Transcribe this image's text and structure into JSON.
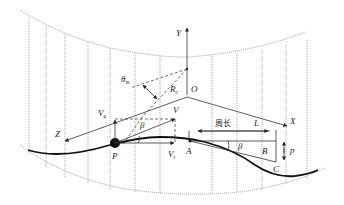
{
  "diagram": {
    "axes": {
      "x": "X",
      "y": "Y",
      "z": "Z",
      "origin": "O"
    },
    "labels": {
      "theta_main": "θ",
      "theta_sub": "m",
      "radius_main": "R",
      "radius_sub": "c",
      "velocity": "V",
      "velocity_a_main": "V",
      "velocity_a_sub": "a",
      "velocity_t_main": "V",
      "velocity_t_sub": "t",
      "beta_1": "β",
      "beta_2": "β",
      "point_p": "P",
      "point_a": "A",
      "point_b": "B",
      "point_c": "C",
      "pitch": "p",
      "length": "L",
      "circumference": "周长"
    },
    "colors": {
      "line": "#333333",
      "curve": "#111111",
      "grid": "#777777"
    }
  }
}
